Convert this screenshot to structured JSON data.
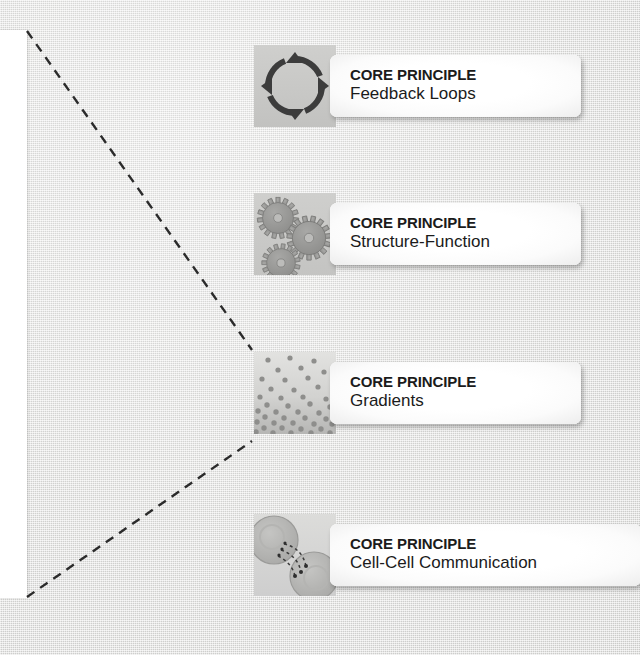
{
  "figure": {
    "background_color": "#e3e3e1",
    "icon_tile_color": "#c9c9c7",
    "card_color": "#ffffff",
    "text_color": "#1b1b1b",
    "connector_color": "#2b2b2b",
    "page_panel_color": "#ffffff"
  },
  "cards": [
    {
      "kicker": "CORE PRINCIPLE",
      "title": "Feedback Loops",
      "icon": "feedback-loop-icon",
      "top": 45,
      "left": 254,
      "plate_width": 215
    },
    {
      "kicker": "CORE PRINCIPLE",
      "title": "Structure-Function",
      "icon": "gears-icon",
      "top": 193,
      "left": 254,
      "plate_width": 215
    },
    {
      "kicker": "CORE PRINCIPLE",
      "title": "Gradients",
      "icon": "gradient-dots-icon",
      "top": 352,
      "left": 254,
      "plate_width": 215
    },
    {
      "kicker": "CORE PRINCIPLE",
      "title": "Cell-Cell Communication",
      "icon": "cell-communication-icon",
      "top": 514,
      "left": 254,
      "plate_width": 275
    }
  ],
  "connectors": {
    "label": "callout-lines",
    "lines": [
      {
        "x1": 27,
        "y1": 31,
        "x2": 252,
        "y2": 350
      },
      {
        "x1": 27,
        "y1": 597,
        "x2": 252,
        "y2": 441
      }
    ]
  }
}
